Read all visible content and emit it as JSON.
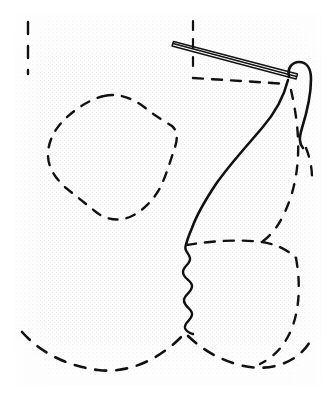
{
  "figure": {
    "title": "Surgical needle and suture line drawing",
    "caption": "",
    "width": 336,
    "height": 400,
    "background_color": "#ffffff",
    "paper_color": "#fdfdfd",
    "ink_color": "#111111",
    "texture": {
      "name": "halftone-grid-texture",
      "color": "#e9e9ea",
      "cell": 4,
      "region": {
        "x": 14,
        "y": 14,
        "width": 308,
        "height": 372
      }
    }
  },
  "elements": [
    {
      "id": "needle",
      "name": "suture-needle",
      "kind": "solid-double-line",
      "description": "Long thin straight needle angled down to the right, drawn as a narrow elongated sliver",
      "stroke": "#111111",
      "stroke_width": 1.4,
      "outline": "M 173.5 41.5 L 297.5 74.0 L 296.0 79.0 L 172.0 46.0 Z",
      "spine": "M 173 43.5 L 296.5 76.5"
    },
    {
      "id": "tissue-solid",
      "name": "tissue-solid-contour",
      "kind": "solid-curve",
      "description": "Main solid contour: rounded hook at top right descending in an S curve to mid field",
      "stroke": "#111111",
      "stroke_width": 2.6,
      "path": "M 289 77 C 287 68, 292 62, 299 62 C 307 62, 311 69, 311 79 C 311 95, 307 112, 302 128 C 299 138, 299 143, 303 148"
    },
    {
      "id": "tissue-solid-main",
      "name": "tissue-solid-main-contour",
      "kind": "solid-curve",
      "description": "Solid contour from needle eye sweeping down and left into the wavy suture line",
      "stroke": "#111111",
      "stroke_width": 2.6,
      "path": "M 288 80 C 284 96, 276 112, 262 128 C 246 147, 230 164, 216 184 C 206 199, 197 214, 192 228 C 189 235, 187 240, 186 245"
    },
    {
      "id": "suture-wavy",
      "name": "wavy-suture-line",
      "kind": "solid-wavy",
      "description": "Serpentine zigzag suture running vertically from mid field down to the lower dashed contour",
      "stroke": "#111111",
      "stroke_width": 2.4,
      "path": "M 186 245 C 183 250, 189 253, 190 258 C 191 264, 183 266, 183 272 C 183 279, 192 280, 192 286 C 192 293, 183 295, 184 301 C 185 308, 193 309, 192 315 C 191 321, 184 322, 185 328 C 186 332, 190 333, 193 334"
    },
    {
      "id": "dash-blob-left",
      "name": "dashed-blob-outline-left",
      "kind": "dashed-closed",
      "description": "Irregular closed dashed blob in the upper left quadrant",
      "stroke": "#111111",
      "stroke_width": 2.4,
      "dash": "9 9",
      "path": "M 104 96 C 120 92, 136 100, 148 110 C 158 118, 166 122, 172 126 C 178 131, 178 140, 174 150 C 170 162, 166 176, 160 188 C 154 199, 144 210, 132 216 C 120 222, 106 220, 96 212 C 86 204, 76 196, 66 188 C 56 179, 48 168, 48 155 C 48 142, 54 130, 64 120 C 74 110, 90 99, 104 96 Z"
    },
    {
      "id": "dash-corner-top",
      "name": "dashed-corner-guide-top",
      "kind": "dashed-open",
      "description": "Vertical dashed guide line near the needle crossing point",
      "stroke": "#111111",
      "stroke_width": 2.2,
      "dash": "9 9",
      "path": "M 193 21 L 193 74"
    },
    {
      "id": "dash-horizontal-top",
      "name": "dashed-horizontal-guide",
      "kind": "dashed-open",
      "description": "Horizontal dashed guide sweeping right toward the solid hook",
      "stroke": "#111111",
      "stroke_width": 2.4,
      "dash": "10 9",
      "path": "M 193 78 C 225 80, 258 82, 287 84"
    },
    {
      "id": "dash-left-edge",
      "name": "dashed-left-edge-marks",
      "kind": "dashed-open",
      "description": "Short vertical dashes along the upper left margin",
      "stroke": "#111111",
      "stroke_width": 2.4,
      "dash": "12 12",
      "path": "M 28 22 L 28 74"
    },
    {
      "id": "dash-inner-right",
      "name": "dashed-inner-right-contour",
      "kind": "dashed-open",
      "description": "Dashed contour paralleling the solid line on the right, descending from the hook",
      "stroke": "#111111",
      "stroke_width": 2.4,
      "dash": "9 10",
      "path": "M 291 90 C 296 112, 299 134, 298 156 C 297 178, 292 198, 283 216 C 277 228, 270 236, 262 242"
    },
    {
      "id": "dash-mid-horizontal",
      "name": "dashed-mid-horizontal-contour",
      "kind": "dashed-open",
      "description": "Dashed line crossing the field at mid height toward the right",
      "stroke": "#111111",
      "stroke_width": 2.4,
      "dash": "10 9",
      "path": "M 186 245 C 212 241, 238 239, 262 242 C 276 244, 288 250, 296 258"
    },
    {
      "id": "dash-lower-right-lobe",
      "name": "dashed-lower-right-lobe",
      "kind": "dashed-open",
      "description": "Dashed lobe descending on the right side down to the bottom contour",
      "stroke": "#111111",
      "stroke_width": 2.4,
      "dash": "9 10",
      "path": "M 296 258 C 300 280, 300 302, 294 322 C 288 342, 276 356, 260 364"
    },
    {
      "id": "dash-bottom-contour",
      "name": "dashed-bottom-contour",
      "kind": "dashed-open",
      "description": "Long dashed contour sweeping across the bottom of the field",
      "stroke": "#111111",
      "stroke_width": 2.6,
      "dash": "11 10",
      "path": "M 22 332 C 40 352, 66 366, 98 370 C 130 374, 162 358, 185 333 C 200 348, 216 358, 236 364 C 252 369, 268 369, 282 364 C 296 359, 306 350, 312 338"
    },
    {
      "id": "dash-right-margin",
      "name": "dashed-right-margin-mark",
      "kind": "dashed-open",
      "description": "Short dashed stroke near the right margin below the solid hook",
      "stroke": "#111111",
      "stroke_width": 2.4,
      "dash": "9 10",
      "path": "M 306 148 C 310 158, 312 168, 312 178"
    }
  ],
  "labels": []
}
